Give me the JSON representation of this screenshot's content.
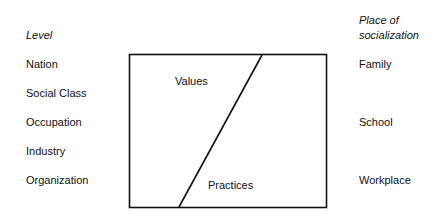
{
  "left_column": {
    "header": "Level",
    "items": [
      "Nation",
      "Social Class",
      "Occupation",
      "Industry",
      "Organization"
    ]
  },
  "right_column": {
    "header_line1": "Place of",
    "header_line2": "socialization",
    "items": [
      "Family",
      "School",
      "Workplace"
    ]
  },
  "box": {
    "upper_label": "Values",
    "lower_label": "Practices"
  }
}
